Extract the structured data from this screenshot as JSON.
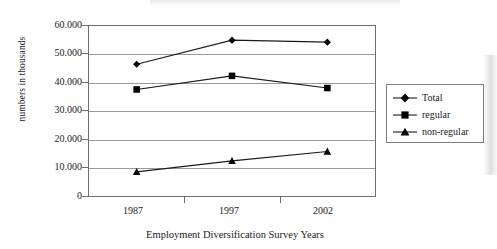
{
  "chart_data": {
    "type": "line",
    "title": "",
    "xlabel": "Employment Diversification Survey Years",
    "ylabel": "numbers in thousands",
    "categories": [
      "1987",
      "1997",
      "2002"
    ],
    "series": [
      {
        "name": "Total",
        "marker": "diamond",
        "values": [
          46500,
          55000,
          54300
        ]
      },
      {
        "name": "regular",
        "marker": "square",
        "values": [
          37600,
          42400,
          38100
        ]
      },
      {
        "name": "non-regular",
        "marker": "triangle",
        "values": [
          8500,
          12400,
          15700
        ]
      }
    ],
    "ylim": [
      0,
      60000
    ],
    "ytick_labels": [
      "60.000",
      "50.000",
      "40.000",
      "30.000",
      "20.000",
      "10.000",
      "0"
    ],
    "ytick_values": [
      60000,
      50000,
      40000,
      30000,
      20000,
      10000,
      0
    ],
    "grid": "horizontal",
    "legend_position": "right",
    "colors": {
      "line": "#1a1a1a",
      "marker": "#000000",
      "grid": "#9a9a9a",
      "axis": "#6f6f6f",
      "background": "#ffffff"
    }
  },
  "legend": {
    "items": [
      {
        "label": "Total",
        "icon": "diamond-marker-icon"
      },
      {
        "label": "regular",
        "icon": "square-marker-icon"
      },
      {
        "label": "non-regular",
        "icon": "triangle-marker-icon"
      }
    ]
  },
  "axes": {
    "y_title": "numbers in thousands",
    "x_title": "Employment Diversification Survey Years",
    "y_ticks": [
      "60.000",
      "50.000",
      "40.000",
      "30.000",
      "20.000",
      "10.000",
      "0"
    ],
    "x_ticks": [
      "1987",
      "1997",
      "2002"
    ]
  }
}
